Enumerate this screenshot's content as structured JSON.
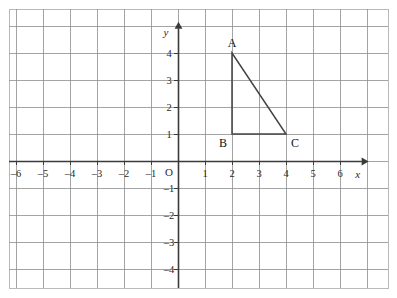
{
  "figure": {
    "kind": "cartesian-coordinate-grid",
    "background_color": "#ffffff",
    "border_color": "#b9b9b9",
    "grid_color": "#8d8d8d",
    "axis_color": "#3a3a3a",
    "shape_color": "#444444",
    "plot_box": {
      "left": 9,
      "top": 9,
      "right": 388,
      "bottom": 288
    },
    "origin_px": {
      "x": 178,
      "y": 161
    },
    "unit_px": 27
  },
  "axes": {
    "x_label": "x",
    "y_label": "y",
    "origin_label": "O",
    "x_ticks": [
      {
        "value": -6,
        "label": "–6"
      },
      {
        "value": -5,
        "label": "–5"
      },
      {
        "value": -4,
        "label": "–4"
      },
      {
        "value": -3,
        "label": "–3"
      },
      {
        "value": -2,
        "label": "–2"
      },
      {
        "value": -1,
        "label": "–1"
      },
      {
        "value": 1,
        "label": "1"
      },
      {
        "value": 2,
        "label": "2"
      },
      {
        "value": 3,
        "label": "3"
      },
      {
        "value": 4,
        "label": "4"
      },
      {
        "value": 5,
        "label": "5"
      },
      {
        "value": 6,
        "label": "6"
      }
    ],
    "y_ticks": [
      {
        "value": 4,
        "label": "4"
      },
      {
        "value": 3,
        "label": "3"
      },
      {
        "value": 2,
        "label": "2"
      },
      {
        "value": 1,
        "label": "1"
      },
      {
        "value": -1,
        "label": "–1"
      },
      {
        "value": -2,
        "label": "–2"
      },
      {
        "value": -3,
        "label": "–3"
      },
      {
        "value": -4,
        "label": "–4"
      }
    ],
    "x_arrow_at": 6.8,
    "y_arrow_at": 4.9
  },
  "chart_data": {
    "type": "scatter",
    "title": "",
    "xlabel": "x",
    "ylabel": "y",
    "xlim": [
      -6.3,
      7.0
    ],
    "ylim": [
      -4.8,
      5.2
    ],
    "grid": true,
    "legend": "none",
    "shapes": [
      {
        "name": "triangle-ABC",
        "closed": true,
        "vertices": [
          {
            "label": "A",
            "x": 2,
            "y": 4,
            "label_pos": "above"
          },
          {
            "label": "B",
            "x": 2,
            "y": 1,
            "label_pos": "below-left"
          },
          {
            "label": "C",
            "x": 4,
            "y": 1,
            "label_pos": "below-right"
          }
        ]
      }
    ],
    "annotations": [
      {
        "text": "A",
        "x": 2,
        "y": 4
      },
      {
        "text": "B",
        "x": 2,
        "y": 1
      },
      {
        "text": "C",
        "x": 4,
        "y": 1
      }
    ]
  }
}
